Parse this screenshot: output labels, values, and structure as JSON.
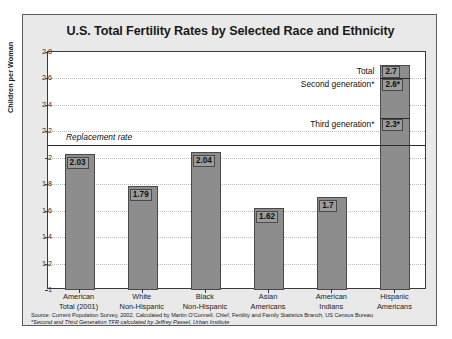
{
  "chart_data": {
    "type": "bar",
    "title": "U.S. Total Fertility Rates by Selected Race and Ethnicity",
    "xlabel": "",
    "ylabel": "Children per Woman",
    "ylim": [
      1,
      2.8
    ],
    "ytick_labels": [
      "2.8",
      "2.6",
      "2.4",
      "2.2",
      "2",
      "1.8",
      "1.6",
      "1.4",
      "1.2",
      "1"
    ],
    "ytick_values": [
      2.8,
      2.6,
      2.4,
      2.2,
      2.0,
      1.8,
      1.6,
      1.4,
      1.2,
      1.0
    ],
    "grid": true,
    "legend": "none",
    "categories": [
      "American\nTotal (2001)",
      "White\nNon-Hispanic",
      "Black\nNon-Hispanic",
      "Asian\nAmericans",
      "American\nIndians",
      "Hispanic\nAmericans"
    ],
    "category_lines": [
      [
        "American",
        "Total (2001)"
      ],
      [
        "White",
        "Non-Hispanic"
      ],
      [
        "Black",
        "Non-Hispanic"
      ],
      [
        "Asian",
        "Americans"
      ],
      [
        "American",
        "Indians"
      ],
      [
        "Hispanic",
        "Americans"
      ]
    ],
    "values": [
      2.03,
      1.79,
      2.04,
      1.62,
      1.7,
      2.7
    ],
    "value_labels": [
      "2.03",
      "1.79",
      "2.04",
      "1.62",
      "1.7",
      "2.7"
    ],
    "annotations": [
      {
        "name": "replacement-rate",
        "label": "Replacement rate",
        "value": 2.1,
        "style": "italic-line"
      },
      {
        "name": "total",
        "label": "Total",
        "value_label": "2.7",
        "value": 2.7
      },
      {
        "name": "second-generation",
        "label": "Second generation*",
        "value_label": "2.6*",
        "value": 2.6
      },
      {
        "name": "third-generation",
        "label": "Third generation*",
        "value_label": "2.3*",
        "value": 2.3
      }
    ]
  },
  "footnote": {
    "line1": "Source: Current Population Survey, 2002, Calculated by Martin O'Connell, Chief, Fertility and Family Statistics Branch, US Census Bureau",
    "line2": "*Second and Third Generation TFR calculated by Jeffrey Passel, Urban Institute"
  },
  "colors": {
    "bar_fill": "#8d8d8d",
    "bar_border": "#4a4a4a",
    "card_background": "#e9e9e9",
    "plot_background": "#ffffff",
    "text": "#111111"
  }
}
